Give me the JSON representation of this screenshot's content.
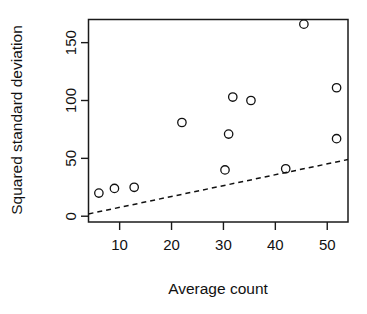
{
  "chart_data": {
    "type": "scatter",
    "title": "",
    "subtitle": "",
    "xlabel": "Average count",
    "ylabel": "Squared standard deviation",
    "xlim": [
      4,
      54
    ],
    "ylim": [
      -5,
      170
    ],
    "xticks": [
      10,
      20,
      30,
      40,
      50
    ],
    "xtick_labels": [
      "10",
      "20",
      "30",
      "40",
      "50"
    ],
    "yticks": [
      0,
      50,
      100,
      150
    ],
    "ytick_labels": [
      "0",
      "50",
      "100",
      "150"
    ],
    "grid": false,
    "legend": null,
    "marker": "open-circle",
    "points": [
      {
        "x": 6.0,
        "y": 20
      },
      {
        "x": 9.0,
        "y": 24
      },
      {
        "x": 12.8,
        "y": 25
      },
      {
        "x": 22.0,
        "y": 81
      },
      {
        "x": 30.3,
        "y": 40
      },
      {
        "x": 31.0,
        "y": 71
      },
      {
        "x": 31.8,
        "y": 103
      },
      {
        "x": 35.3,
        "y": 100
      },
      {
        "x": 42.0,
        "y": 41
      },
      {
        "x": 45.5,
        "y": 166
      },
      {
        "x": 51.8,
        "y": 111
      },
      {
        "x": 51.8,
        "y": 67
      }
    ],
    "series": [
      {
        "name": "observations",
        "type": "scatter",
        "x": [
          6.0,
          9.0,
          12.8,
          22.0,
          30.3,
          31.0,
          31.8,
          35.3,
          42.0,
          45.5,
          51.8,
          51.8
        ],
        "values": [
          20,
          24,
          25,
          81,
          40,
          71,
          103,
          100,
          41,
          166,
          111,
          67
        ]
      },
      {
        "name": "reference-line",
        "type": "line",
        "style": "dashed",
        "x": [
          4.0,
          54.0
        ],
        "values": [
          2,
          49
        ]
      }
    ],
    "annotations": []
  },
  "axes": {
    "x_title": "Average count",
    "y_title": "Squared standard deviation"
  },
  "tick_text": {
    "x": [
      "10",
      "20",
      "30",
      "40",
      "50"
    ],
    "y": [
      "0",
      "50",
      "100",
      "150"
    ]
  },
  "colors": {
    "foreground": "#111111",
    "background": "#ffffff",
    "marker_stroke": "#111111",
    "line_stroke": "#111111"
  }
}
